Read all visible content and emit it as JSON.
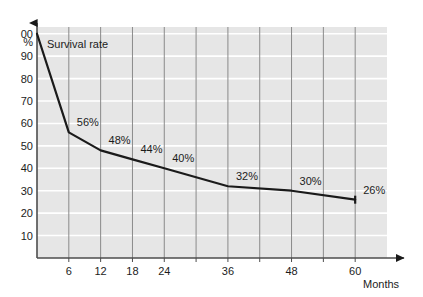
{
  "chart_data": {
    "type": "line",
    "title": "",
    "subtitle": "",
    "xlabel": "Months",
    "ylabel": "",
    "series_label": "Survival rate",
    "grid": {
      "vertical": true,
      "horizontal": true,
      "vertical_color": "#808080",
      "horizontal_color": "#ffffff"
    },
    "plot_background": "#e6e6e6",
    "line_color": "#1a1a1a",
    "axis_color": "#4d4d4d",
    "x": [
      0,
      6,
      12,
      18,
      24,
      36,
      48,
      60
    ],
    "values": [
      100,
      56,
      48,
      44,
      40,
      32,
      30,
      26
    ],
    "point_labels": [
      "",
      "56%",
      "48%",
      "44%",
      "40%",
      "32%",
      "30%",
      "26%"
    ],
    "xlim": [
      0,
      66
    ],
    "ylim": [
      0,
      103
    ],
    "x_ticks": [
      6,
      12,
      18,
      24,
      30,
      36,
      42,
      48,
      54,
      60
    ],
    "x_tick_labels": [
      "6",
      "12",
      "18",
      "24",
      "",
      "36",
      "",
      "48",
      "",
      "60"
    ],
    "y_ticks": [
      10,
      20,
      30,
      40,
      50,
      60,
      70,
      80,
      90,
      100
    ],
    "y_tick_labels": [
      "10",
      "20",
      "30",
      "40",
      "50",
      "60",
      "70",
      "80",
      "90",
      "100"
    ],
    "y_top_label_clipped": "00",
    "y_unit_label": "%",
    "legend_position": "none"
  }
}
